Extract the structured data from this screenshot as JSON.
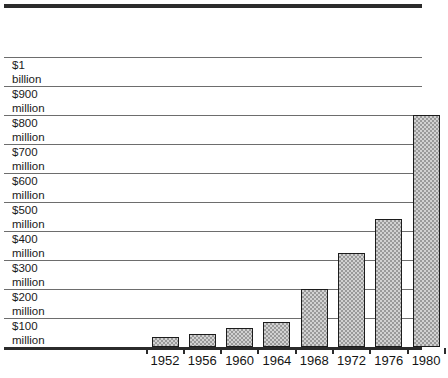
{
  "chart_data": {
    "type": "bar",
    "title": "",
    "subtitle": "",
    "xlabel": "",
    "ylabel": "",
    "categories": [
      "1952",
      "1956",
      "1960",
      "1964",
      "1968",
      "1972",
      "1976",
      "1980"
    ],
    "values": [
      35,
      45,
      65,
      85,
      200,
      325,
      440,
      800
    ],
    "value_unit": "millions of dollars",
    "ylim": [
      0,
      1000
    ],
    "ytick_values": [
      100,
      200,
      300,
      400,
      500,
      600,
      700,
      800,
      900,
      1000
    ],
    "ytick_labels": [
      {
        "num": "$100",
        "unit": "million"
      },
      {
        "num": "$200",
        "unit": "million"
      },
      {
        "num": "$300",
        "unit": "million"
      },
      {
        "num": "$400",
        "unit": "million"
      },
      {
        "num": "$500",
        "unit": "million"
      },
      {
        "num": "$600",
        "unit": "million"
      },
      {
        "num": "$700",
        "unit": "million"
      },
      {
        "num": "$800",
        "unit": "million"
      },
      {
        "num": "$900",
        "unit": "million"
      },
      {
        "num": "$1",
        "unit": "billion"
      }
    ],
    "grid": true,
    "grid_orientation": "horizontal",
    "legend": false,
    "legend_position": "none",
    "bar_fill": "#d2d2d2",
    "bar_pattern": "checkerboard-dither",
    "bar_outline": "#1c1c1c",
    "gridline_color": "#6d6d6d",
    "frame_color": "#2b2b2b",
    "background": "#ffffff"
  },
  "caption": {
    "text": ""
  }
}
